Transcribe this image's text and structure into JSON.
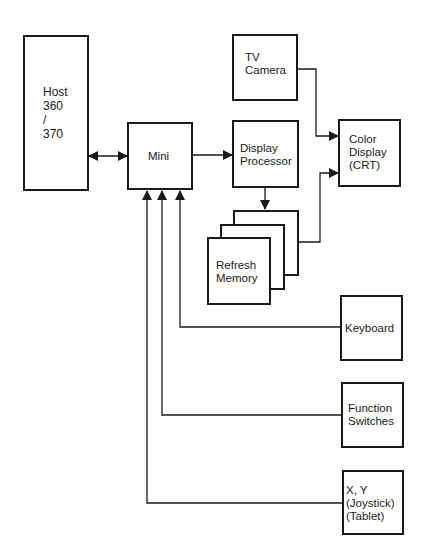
{
  "diagram": {
    "type": "block-diagram",
    "nodes": {
      "host": {
        "label": "Host\n360\n/\n370"
      },
      "mini": {
        "label": "Mini"
      },
      "tv_camera": {
        "label": "TV\nCamera"
      },
      "display_processor": {
        "label": "Display\nProcessor"
      },
      "color_display": {
        "label": "Color\nDisplay\n(CRT)"
      },
      "refresh_memory": {
        "label": "Refresh\nMemory"
      },
      "keyboard": {
        "label": "Keyboard"
      },
      "function_switches": {
        "label": "Function\nSwitches"
      },
      "xy_input": {
        "label": "X, Y\n(Joystick)\n(Tablet)"
      }
    },
    "edges": [
      {
        "from": "host",
        "to": "mini",
        "bidirectional": true
      },
      {
        "from": "mini",
        "to": "display_processor"
      },
      {
        "from": "display_processor",
        "to": "refresh_memory"
      },
      {
        "from": "tv_camera",
        "to": "color_display"
      },
      {
        "from": "refresh_memory",
        "to": "color_display"
      },
      {
        "from": "keyboard",
        "to": "mini"
      },
      {
        "from": "function_switches",
        "to": "mini"
      },
      {
        "from": "xy_input",
        "to": "mini"
      }
    ],
    "line_color": "#1a1a1a"
  }
}
